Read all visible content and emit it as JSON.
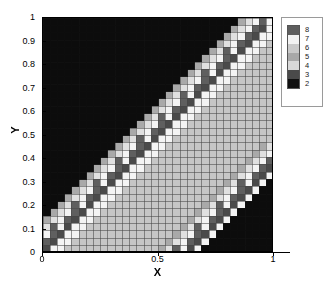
{
  "chart_data": {
    "type": "heatmap",
    "title": "",
    "xlabel": "X",
    "ylabel": "Y",
    "xlim": [
      0,
      1
    ],
    "ylim": [
      0,
      1
    ],
    "x_ticks": [
      0,
      0.5,
      1
    ],
    "x_tick_labels": [
      "0",
      "0.5",
      "1"
    ],
    "y_ticks": [
      0,
      0.1,
      0.2,
      0.3,
      0.4,
      0.5,
      0.6,
      0.7,
      0.8,
      0.9,
      1
    ],
    "y_tick_labels": [
      "0",
      "0.1",
      "0.2",
      "0.3",
      "0.4",
      "0.5",
      "0.6",
      "0.7",
      "0.8",
      "0.9",
      "1"
    ],
    "grid": true,
    "grid_color": "#7a7a7a",
    "colormap": "gray-discrete",
    "legend_position": "right",
    "colorbar": {
      "tick_values": [
        8,
        7,
        6,
        5,
        4,
        3,
        2
      ],
      "tick_labels": [
        "8",
        "7",
        "6",
        "5",
        "4",
        "3",
        "2"
      ],
      "swatch_colors_top_to_bottom": [
        "#5e5e5e",
        "#f2f2f2",
        "#c9c9c9",
        "#a8a8a8",
        "#d8d8d8",
        "#4a4a4a",
        "#101010"
      ]
    },
    "level_colors": {
      "2": "#0d0d0d",
      "3": "#4a4a4a",
      "4": "#e0e0e0",
      "5": "#a9a9a9",
      "6": "#c6c6c6",
      "7": "#f4f4f4",
      "8": "#5f5f5f"
    },
    "nx": 32,
    "ny": 32,
    "z_matrix_rows_top_to_bottom": [
      [
        2,
        2,
        2,
        2,
        2,
        2,
        2,
        2,
        2,
        2,
        2,
        2,
        2,
        2,
        2,
        2,
        2,
        2,
        2,
        2,
        2,
        2,
        2,
        2,
        2,
        2,
        2,
        5,
        4,
        7,
        8,
        7
      ],
      [
        2,
        2,
        2,
        2,
        2,
        2,
        2,
        2,
        2,
        2,
        2,
        2,
        2,
        2,
        2,
        2,
        2,
        2,
        2,
        2,
        2,
        2,
        2,
        2,
        2,
        2,
        5,
        4,
        7,
        8,
        3,
        7
      ],
      [
        2,
        2,
        2,
        2,
        2,
        2,
        2,
        2,
        2,
        2,
        2,
        2,
        2,
        2,
        2,
        2,
        2,
        2,
        2,
        2,
        2,
        2,
        2,
        2,
        2,
        5,
        4,
        7,
        8,
        3,
        7,
        7
      ],
      [
        2,
        2,
        2,
        2,
        2,
        2,
        2,
        2,
        2,
        2,
        2,
        2,
        2,
        2,
        2,
        2,
        2,
        2,
        2,
        2,
        2,
        2,
        2,
        2,
        5,
        4,
        7,
        8,
        3,
        7,
        7,
        6
      ],
      [
        2,
        2,
        2,
        2,
        2,
        2,
        2,
        2,
        2,
        2,
        2,
        2,
        2,
        2,
        2,
        2,
        2,
        2,
        2,
        2,
        2,
        2,
        2,
        5,
        4,
        8,
        7,
        3,
        7,
        7,
        6,
        6
      ],
      [
        2,
        2,
        2,
        2,
        2,
        2,
        2,
        2,
        2,
        2,
        2,
        2,
        2,
        2,
        2,
        2,
        2,
        2,
        2,
        2,
        2,
        2,
        5,
        4,
        7,
        8,
        3,
        7,
        7,
        6,
        6,
        6
      ],
      [
        2,
        2,
        2,
        2,
        2,
        2,
        2,
        2,
        2,
        2,
        2,
        2,
        2,
        2,
        2,
        2,
        2,
        2,
        2,
        2,
        2,
        5,
        4,
        7,
        8,
        3,
        7,
        7,
        6,
        6,
        6,
        6
      ],
      [
        2,
        2,
        2,
        2,
        2,
        2,
        2,
        2,
        2,
        2,
        2,
        2,
        2,
        2,
        2,
        2,
        2,
        2,
        2,
        2,
        5,
        4,
        8,
        7,
        3,
        7,
        7,
        6,
        6,
        6,
        6,
        6
      ],
      [
        2,
        2,
        2,
        2,
        2,
        2,
        2,
        2,
        2,
        2,
        2,
        2,
        2,
        2,
        2,
        2,
        2,
        2,
        2,
        5,
        4,
        7,
        8,
        3,
        7,
        7,
        6,
        6,
        6,
        6,
        6,
        6
      ],
      [
        2,
        2,
        2,
        2,
        2,
        2,
        2,
        2,
        2,
        2,
        2,
        2,
        2,
        2,
        2,
        2,
        2,
        2,
        5,
        4,
        7,
        8,
        3,
        7,
        7,
        6,
        6,
        6,
        6,
        6,
        6,
        6
      ],
      [
        2,
        2,
        2,
        2,
        2,
        2,
        2,
        2,
        2,
        2,
        2,
        2,
        2,
        2,
        2,
        2,
        2,
        5,
        4,
        8,
        7,
        3,
        7,
        7,
        6,
        6,
        6,
        6,
        6,
        6,
        6,
        6
      ],
      [
        2,
        2,
        2,
        2,
        2,
        2,
        2,
        2,
        2,
        2,
        2,
        2,
        2,
        2,
        2,
        2,
        5,
        4,
        7,
        8,
        3,
        7,
        7,
        6,
        6,
        6,
        6,
        6,
        6,
        6,
        6,
        6
      ],
      [
        2,
        2,
        2,
        2,
        2,
        2,
        2,
        2,
        2,
        2,
        2,
        2,
        2,
        2,
        2,
        5,
        4,
        7,
        8,
        3,
        7,
        7,
        6,
        6,
        6,
        6,
        6,
        6,
        6,
        6,
        6,
        6
      ],
      [
        2,
        2,
        2,
        2,
        2,
        2,
        2,
        2,
        2,
        2,
        2,
        2,
        2,
        2,
        5,
        4,
        8,
        7,
        3,
        7,
        7,
        6,
        6,
        6,
        6,
        6,
        6,
        6,
        6,
        6,
        6,
        6
      ],
      [
        2,
        2,
        2,
        2,
        2,
        2,
        2,
        2,
        2,
        2,
        2,
        2,
        2,
        5,
        4,
        7,
        8,
        3,
        7,
        7,
        6,
        6,
        6,
        6,
        6,
        6,
        6,
        6,
        6,
        6,
        6,
        6
      ],
      [
        2,
        2,
        2,
        2,
        2,
        2,
        2,
        2,
        2,
        2,
        2,
        2,
        5,
        4,
        7,
        8,
        3,
        7,
        7,
        6,
        6,
        6,
        6,
        6,
        6,
        6,
        6,
        6,
        6,
        6,
        6,
        6
      ],
      [
        2,
        2,
        2,
        2,
        2,
        2,
        2,
        2,
        2,
        2,
        2,
        5,
        4,
        8,
        7,
        3,
        7,
        7,
        6,
        6,
        6,
        6,
        6,
        6,
        6,
        6,
        6,
        6,
        6,
        6,
        6,
        6
      ],
      [
        2,
        2,
        2,
        2,
        2,
        2,
        2,
        2,
        2,
        2,
        5,
        4,
        7,
        8,
        3,
        7,
        7,
        6,
        6,
        6,
        6,
        6,
        6,
        6,
        6,
        6,
        6,
        6,
        6,
        6,
        5,
        4
      ],
      [
        2,
        2,
        2,
        2,
        2,
        2,
        2,
        2,
        2,
        5,
        4,
        7,
        8,
        3,
        7,
        7,
        6,
        6,
        6,
        6,
        6,
        6,
        6,
        6,
        6,
        6,
        6,
        6,
        6,
        5,
        4,
        7
      ],
      [
        2,
        2,
        2,
        2,
        2,
        2,
        2,
        2,
        5,
        4,
        8,
        7,
        3,
        7,
        7,
        6,
        6,
        6,
        6,
        6,
        6,
        6,
        6,
        6,
        6,
        6,
        6,
        6,
        5,
        4,
        7,
        8
      ],
      [
        2,
        2,
        2,
        2,
        2,
        2,
        2,
        5,
        4,
        7,
        8,
        3,
        7,
        7,
        6,
        6,
        6,
        6,
        6,
        6,
        6,
        6,
        6,
        6,
        6,
        6,
        6,
        5,
        4,
        7,
        8,
        3
      ],
      [
        2,
        2,
        2,
        2,
        2,
        2,
        5,
        4,
        7,
        8,
        3,
        7,
        7,
        6,
        6,
        6,
        6,
        6,
        6,
        6,
        6,
        6,
        6,
        6,
        6,
        6,
        5,
        4,
        7,
        8,
        3,
        7
      ],
      [
        2,
        2,
        2,
        2,
        2,
        5,
        4,
        8,
        7,
        3,
        7,
        7,
        6,
        6,
        6,
        6,
        6,
        6,
        6,
        6,
        6,
        6,
        6,
        6,
        6,
        5,
        4,
        8,
        7,
        3,
        7,
        2
      ],
      [
        2,
        2,
        2,
        2,
        5,
        4,
        7,
        8,
        3,
        7,
        7,
        6,
        6,
        6,
        6,
        6,
        6,
        6,
        6,
        6,
        6,
        6,
        6,
        6,
        5,
        4,
        7,
        8,
        3,
        7,
        2,
        2
      ],
      [
        2,
        2,
        2,
        5,
        4,
        7,
        8,
        3,
        7,
        7,
        6,
        6,
        6,
        6,
        6,
        6,
        6,
        6,
        6,
        6,
        6,
        6,
        6,
        5,
        4,
        7,
        8,
        3,
        7,
        2,
        2,
        2
      ],
      [
        2,
        2,
        5,
        4,
        8,
        7,
        3,
        7,
        7,
        6,
        6,
        6,
        6,
        6,
        6,
        6,
        6,
        6,
        6,
        6,
        6,
        6,
        5,
        4,
        8,
        7,
        3,
        7,
        2,
        2,
        2,
        2
      ],
      [
        2,
        5,
        4,
        7,
        8,
        3,
        7,
        7,
        6,
        6,
        6,
        6,
        6,
        6,
        6,
        6,
        6,
        6,
        6,
        6,
        6,
        5,
        4,
        7,
        8,
        3,
        7,
        2,
        2,
        2,
        2,
        2
      ],
      [
        5,
        4,
        7,
        8,
        3,
        7,
        7,
        6,
        6,
        6,
        6,
        6,
        6,
        6,
        6,
        6,
        6,
        6,
        6,
        6,
        5,
        4,
        7,
        8,
        3,
        7,
        2,
        2,
        2,
        2,
        2,
        2
      ],
      [
        4,
        8,
        7,
        3,
        7,
        7,
        6,
        6,
        6,
        6,
        6,
        6,
        6,
        6,
        6,
        6,
        6,
        6,
        6,
        5,
        4,
        8,
        7,
        3,
        7,
        2,
        2,
        2,
        2,
        2,
        2,
        2
      ],
      [
        7,
        8,
        3,
        7,
        7,
        6,
        6,
        6,
        6,
        6,
        6,
        6,
        6,
        6,
        6,
        6,
        6,
        6,
        5,
        4,
        7,
        8,
        3,
        7,
        2,
        2,
        2,
        2,
        2,
        2,
        2,
        2
      ],
      [
        8,
        3,
        7,
        7,
        6,
        6,
        6,
        6,
        6,
        6,
        6,
        6,
        6,
        6,
        6,
        6,
        6,
        5,
        4,
        7,
        8,
        3,
        7,
        2,
        2,
        2,
        2,
        2,
        2,
        2,
        2,
        2
      ],
      [
        3,
        7,
        7,
        6,
        6,
        6,
        6,
        6,
        6,
        6,
        6,
        6,
        6,
        6,
        6,
        6,
        5,
        4,
        8,
        7,
        3,
        7,
        2,
        2,
        2,
        2,
        2,
        2,
        2,
        2,
        2,
        2
      ]
    ]
  }
}
